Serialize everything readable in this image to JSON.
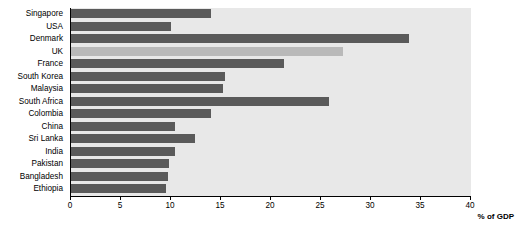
{
  "chart_data": {
    "type": "bar",
    "orientation": "horizontal",
    "title": "",
    "xlabel": "% of GDP",
    "ylabel": "",
    "xlim": [
      0,
      40
    ],
    "xticks": [
      0,
      5,
      10,
      15,
      20,
      25,
      30,
      35,
      40
    ],
    "grid": false,
    "categories": [
      "Singapore",
      "USA",
      "Denmark",
      "UK",
      "France",
      "South Korea",
      "Malaysia",
      "South Africa",
      "Colombia",
      "China",
      "Sri Lanka",
      "India",
      "Pakistan",
      "Bangladesh",
      "Ethiopia"
    ],
    "values": [
      14.0,
      10.0,
      33.8,
      27.2,
      21.3,
      15.4,
      15.2,
      25.8,
      14.0,
      10.4,
      12.4,
      10.4,
      9.8,
      9.7,
      9.5
    ],
    "highlight_category": "UK",
    "colors": {
      "bar": "#5a5a5a",
      "bar_highlight": "#b9b9b9",
      "plot_background": "#e8e8e8",
      "axis": "#000000"
    }
  }
}
